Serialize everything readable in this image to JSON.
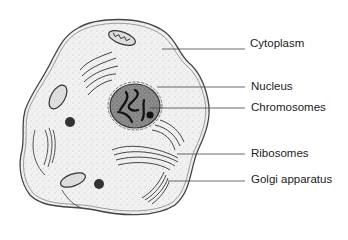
{
  "labels": [
    {
      "id": "cytoplasm",
      "text": "Cytoplasm",
      "x": 250,
      "y": 37,
      "line": {
        "x1": 162,
        "y1": 49,
        "x2": 245,
        "y2": 49
      }
    },
    {
      "id": "nucleus",
      "text": "Nucleus",
      "x": 251,
      "y": 80,
      "line": {
        "x1": 157,
        "y1": 87,
        "x2": 245,
        "y2": 87
      }
    },
    {
      "id": "chromosomes",
      "text": "Chromosomes",
      "x": 251,
      "y": 101,
      "line": {
        "x1": 150,
        "y1": 108,
        "x2": 245,
        "y2": 108
      }
    },
    {
      "id": "ribosomes",
      "text": "Ribosomes",
      "x": 251,
      "y": 147,
      "line": {
        "x1": 177,
        "y1": 154,
        "x2": 245,
        "y2": 154
      }
    },
    {
      "id": "golgi",
      "text": "Golgi apparatus",
      "x": 251,
      "y": 173,
      "line": {
        "x1": 168,
        "y1": 181,
        "x2": 245,
        "y2": 181
      }
    }
  ],
  "colors": {
    "outline": "#333333",
    "fill": "#eeeeee",
    "nucleus": "#8a8a8a",
    "dark": "#222222"
  }
}
